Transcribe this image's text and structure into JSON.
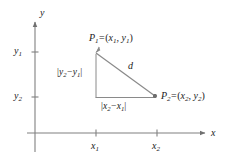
{
  "figure": {
    "type": "distance-formula-diagram",
    "background_color": "#ffffff",
    "line_color": "#808080",
    "text_color": "#1a1a1a"
  },
  "axes": {
    "x_label": "x",
    "y_label": "y",
    "x_ticks": [
      {
        "label_base": "x",
        "label_sub": "1",
        "x": 96
      },
      {
        "label_base": "x",
        "label_sub": "2",
        "x": 157
      }
    ],
    "y_ticks": [
      {
        "label_base": "y",
        "label_sub": "1",
        "y": 52
      },
      {
        "label_base": "y",
        "label_sub": "2",
        "y": 97
      }
    ],
    "origin": {
      "x": 35,
      "y": 133
    }
  },
  "points": {
    "p1": {
      "name_base": "P",
      "name_sub": "1",
      "equals": "=",
      "open_paren": "(",
      "coord_x_base": "x",
      "coord_x_sub": "1",
      "comma": ",",
      "coord_y_base": "y",
      "coord_y_sub": "1",
      "close_paren": ")",
      "vertex": {
        "x": 96,
        "y": 52
      }
    },
    "p2": {
      "name_base": "P",
      "name_sub": "2",
      "equals": "=",
      "open_paren": "(",
      "coord_x_base": "x",
      "coord_x_sub": "2",
      "comma": ",",
      "coord_y_base": "y",
      "coord_y_sub": "2",
      "close_paren": ")",
      "vertex": {
        "x": 157,
        "y": 97
      }
    }
  },
  "segments": {
    "hypotenuse": {
      "label": "d"
    },
    "vertical": {
      "bar_open": "|",
      "first_base": "y",
      "first_sub": "2",
      "minus": "−",
      "second_base": "y",
      "second_sub": "1",
      "bar_close": "|"
    },
    "horizontal": {
      "bar_open": "|",
      "first_base": "x",
      "first_sub": "2",
      "minus": "−",
      "second_base": "x",
      "second_sub": "1",
      "bar_close": "|"
    }
  }
}
